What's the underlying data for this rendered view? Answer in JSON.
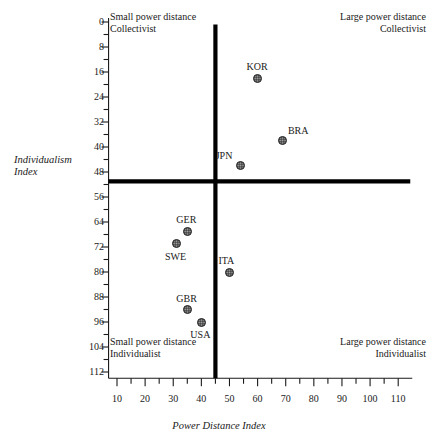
{
  "chart_data": {
    "type": "scatter",
    "title": "",
    "xlabel": "Power Distance Index",
    "ylabel": "Individualism Index",
    "xlim": [
      7,
      115
    ],
    "ylim": [
      0,
      114
    ],
    "y_axis_inverted": true,
    "grid": false,
    "legend": "none",
    "x_major_ticks": [
      10,
      20,
      30,
      40,
      50,
      60,
      70,
      80,
      90,
      100,
      110
    ],
    "x_minor_step": 5,
    "y_major_ticks": [
      0,
      8,
      16,
      24,
      32,
      40,
      48,
      56,
      64,
      72,
      80,
      88,
      96,
      104,
      112
    ],
    "y_minor_step": 4,
    "x_tick_labels": [
      "10",
      "20",
      "30",
      "40",
      "50",
      "60",
      "70",
      "80",
      "90",
      "100",
      "110"
    ],
    "y_tick_labels": [
      "0",
      "8",
      "16",
      "24",
      "32",
      "40",
      "48",
      "56",
      "64",
      "72",
      "80",
      "88",
      "96",
      "104",
      "112"
    ],
    "reference_lines": {
      "vertical_x": 45,
      "horizontal_y": 51
    },
    "points": [
      {
        "label": "KOR",
        "x": 60,
        "y": 18,
        "label_pos": "above"
      },
      {
        "label": "BRA",
        "x": 69,
        "y": 38,
        "label_pos": "above-right"
      },
      {
        "label": "JPN",
        "x": 54,
        "y": 46,
        "label_pos": "above-left"
      },
      {
        "label": "GER",
        "x": 35,
        "y": 67,
        "label_pos": "above"
      },
      {
        "label": "SWE",
        "x": 31,
        "y": 71,
        "label_pos": "below"
      },
      {
        "label": "ITA",
        "x": 50,
        "y": 80,
        "label_pos": "above"
      },
      {
        "label": "GBR",
        "x": 35,
        "y": 92,
        "label_pos": "above"
      },
      {
        "label": "USA",
        "x": 40,
        "y": 96,
        "label_pos": "below"
      }
    ],
    "quadrant_annotations": [
      {
        "id": "top-left",
        "line1": "Small power distance",
        "line2": "Collectivist"
      },
      {
        "id": "top-right",
        "line1": "Large power distance",
        "line2": "Collectivist"
      },
      {
        "id": "bottom-left",
        "line1": "Small power distance",
        "line2": "Individualist"
      },
      {
        "id": "bottom-right",
        "line1": "Large power distance",
        "line2": "Individualist"
      }
    ]
  },
  "axis_titles": {
    "y": "Individualism\nIndex",
    "x": "Power Distance Index"
  },
  "quadrants": {
    "top_left": "Small power distance\nCollectivist",
    "top_right": "Large power distance\nCollectivist",
    "bottom_left": "Small power distance\nIndividualist",
    "bottom_right": "Large power distance\nIndividualist"
  },
  "colors": {
    "marker": "#4a4a4a",
    "axis": "#1a1a1a",
    "reference_line": "#000000",
    "background": "#ffffff"
  }
}
